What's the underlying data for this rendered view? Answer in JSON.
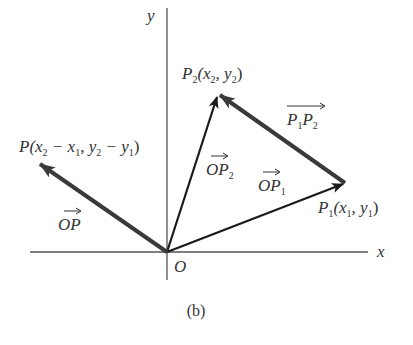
{
  "figure": {
    "caption": "(b)",
    "colors": {
      "axis": "#555555",
      "thin_vector": "#1a1a1a",
      "thick_vector": "#3a3a3a",
      "text": "#333333",
      "background": "#ffffff"
    },
    "axes": {
      "x_label": "x",
      "y_label": "y",
      "origin_label": "O"
    },
    "points": {
      "origin": {
        "name": "O",
        "px": [
          167,
          252
        ]
      },
      "P1": {
        "name": "P",
        "sub": "1",
        "coords_label": "(x₁, y₁)",
        "px": [
          345,
          183
        ]
      },
      "P2": {
        "name": "P",
        "sub": "2",
        "coords_label": "(x₂, y₂)",
        "px": [
          218,
          94
        ]
      },
      "P": {
        "name": "P",
        "coords_label": "(x₂ − x₁, y₂ − y₁)",
        "px": [
          38,
          163
        ]
      }
    },
    "vectors": [
      {
        "id": "OP1",
        "label": "OP₁",
        "from": "O",
        "to": "P1",
        "style": "thin"
      },
      {
        "id": "OP2",
        "label": "OP₂",
        "from": "O",
        "to": "P2",
        "style": "thin"
      },
      {
        "id": "P1P2",
        "label": "P₁P₂",
        "from": "P1",
        "to": "P2",
        "style": "thick"
      },
      {
        "id": "OP",
        "label": "OP",
        "from": "O",
        "to": "P",
        "style": "thick"
      }
    ],
    "labels": {
      "P2_point": {
        "main": "P",
        "sub": "2",
        "rest_a": "(x",
        "sub_a": "2",
        "rest_b": ", y",
        "sub_b": "2",
        "rest_c": ")"
      },
      "P1_point": {
        "main": "P",
        "sub": "1",
        "rest_a": "(x",
        "sub_a": "1",
        "rest_b": ", y",
        "sub_b": "1",
        "rest_c": ")"
      },
      "P_point": {
        "main": "P",
        "rest_a": "(x",
        "sub_a": "2",
        "rest_b": " − x",
        "sub_b": "1",
        "rest_c": ", y",
        "sub_c": "2",
        "rest_d": " − y",
        "sub_d": "1",
        "rest_e": ")"
      },
      "OP_vec": {
        "main": "OP"
      },
      "OP1_vec": {
        "main": "OP",
        "sub": "1"
      },
      "OP2_vec": {
        "main": "OP",
        "sub": "2"
      },
      "P1P2_vec": {
        "main_a": "P",
        "sub_a": "1",
        "main_b": "P",
        "sub_b": "2"
      }
    }
  }
}
